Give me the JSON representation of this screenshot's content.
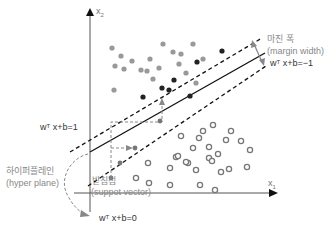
{
  "axes": {
    "x_label": "x",
    "x_sub": "1",
    "y_label": "x",
    "y_sub": "2"
  },
  "labels": {
    "margin_width_ko": "마진 폭",
    "margin_width_en": "(margin width)",
    "neg_boundary": {
      "pre": "w",
      "sup": "T",
      "post": " x+b=−1"
    },
    "pos_boundary": {
      "pre": "w",
      "sup": "T",
      "post": " x+b=1"
    },
    "hyperplane_eq": {
      "pre": "w",
      "sup": "T",
      "post": " x+b=0"
    },
    "hyperplane_ko": "하이퍼플레인",
    "hyperplane_en": "(hyper plane)",
    "support_vector_ko": "받침점",
    "support_vector_en": "(suppot vector)"
  },
  "colors": {
    "filled_light": "#999999",
    "filled_dark": "#222222",
    "hollow": "#777777",
    "line": "#111111",
    "annot": "#888888"
  },
  "points": {
    "filled_light": [
      [
        112,
        48
      ],
      [
        121,
        56
      ],
      [
        132,
        61
      ],
      [
        115,
        66
      ],
      [
        124,
        69
      ],
      [
        141,
        70
      ],
      [
        147,
        71
      ],
      [
        150,
        59
      ],
      [
        159,
        68
      ],
      [
        153,
        79
      ],
      [
        114,
        90
      ],
      [
        163,
        44
      ],
      [
        173,
        52
      ],
      [
        181,
        54
      ],
      [
        179,
        64
      ],
      [
        186,
        73
      ],
      [
        193,
        44
      ],
      [
        196,
        83
      ],
      [
        203,
        59
      ]
    ],
    "filled_dark": [
      [
        143,
        97
      ],
      [
        162,
        88
      ],
      [
        169,
        90
      ],
      [
        190,
        96
      ],
      [
        222,
        51
      ],
      [
        197,
        62
      ],
      [
        174,
        80
      ]
    ],
    "filled_small": [
      [
        135,
        148
      ],
      [
        120,
        163
      ],
      [
        160,
        121
      ],
      [
        111,
        178
      ]
    ],
    "hollow": [
      [
        213,
        125
      ],
      [
        231,
        131
      ],
      [
        250,
        150
      ],
      [
        209,
        147
      ],
      [
        193,
        148
      ],
      [
        176,
        157
      ],
      [
        188,
        163
      ],
      [
        178,
        156
      ],
      [
        186,
        162
      ],
      [
        196,
        170
      ],
      [
        221,
        172
      ],
      [
        209,
        158
      ],
      [
        218,
        154
      ],
      [
        148,
        163
      ],
      [
        170,
        168
      ],
      [
        149,
        183
      ],
      [
        212,
        161
      ],
      [
        226,
        140
      ],
      [
        181,
        136
      ],
      [
        199,
        138
      ],
      [
        203,
        131
      ],
      [
        229,
        169
      ],
      [
        170,
        185
      ],
      [
        136,
        178
      ],
      [
        200,
        185
      ],
      [
        241,
        141
      ],
      [
        247,
        167
      ],
      [
        215,
        190
      ]
    ]
  }
}
